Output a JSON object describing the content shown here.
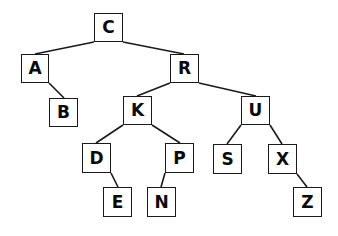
{
  "diagram": {
    "type": "binary-search-tree",
    "colors": {
      "background": "#ffffff",
      "stroke": "#1a1a1a",
      "text": "#0a0a0a"
    },
    "nodes": [
      {
        "id": "C",
        "label": "C",
        "x": 94,
        "y": 13,
        "w": 29,
        "h": 29
      },
      {
        "id": "A",
        "label": "A",
        "x": 21,
        "y": 54,
        "w": 28,
        "h": 29
      },
      {
        "id": "R",
        "label": "R",
        "x": 170,
        "y": 54,
        "w": 29,
        "h": 29
      },
      {
        "id": "B",
        "label": "B",
        "x": 49,
        "y": 98,
        "w": 29,
        "h": 29
      },
      {
        "id": "K",
        "label": "K",
        "x": 123,
        "y": 96,
        "w": 29,
        "h": 29
      },
      {
        "id": "U",
        "label": "U",
        "x": 241,
        "y": 96,
        "w": 29,
        "h": 29
      },
      {
        "id": "D",
        "label": "D",
        "x": 82,
        "y": 143,
        "w": 29,
        "h": 30
      },
      {
        "id": "P",
        "label": "P",
        "x": 165,
        "y": 143,
        "w": 29,
        "h": 30
      },
      {
        "id": "S",
        "label": "S",
        "x": 213,
        "y": 144,
        "w": 29,
        "h": 30
      },
      {
        "id": "X",
        "label": "X",
        "x": 268,
        "y": 144,
        "w": 29,
        "h": 30
      },
      {
        "id": "E",
        "label": "E",
        "x": 103,
        "y": 187,
        "w": 29,
        "h": 30
      },
      {
        "id": "N",
        "label": "N",
        "x": 147,
        "y": 187,
        "w": 29,
        "h": 30
      },
      {
        "id": "Z",
        "label": "Z",
        "x": 293,
        "y": 187,
        "w": 29,
        "h": 30
      }
    ],
    "edges": [
      {
        "from": "C",
        "to": "A",
        "x1": 94,
        "y1": 42,
        "x2": 35,
        "y2": 54
      },
      {
        "from": "C",
        "to": "R",
        "x1": 123,
        "y1": 42,
        "x2": 184,
        "y2": 54
      },
      {
        "from": "A",
        "to": "B",
        "x1": 49,
        "y1": 83,
        "x2": 64,
        "y2": 98
      },
      {
        "from": "R",
        "to": "K",
        "x1": 170,
        "y1": 83,
        "x2": 137,
        "y2": 96
      },
      {
        "from": "R",
        "to": "U",
        "x1": 199,
        "y1": 83,
        "x2": 256,
        "y2": 96
      },
      {
        "from": "K",
        "to": "D",
        "x1": 123,
        "y1": 125,
        "x2": 96,
        "y2": 143
      },
      {
        "from": "K",
        "to": "P",
        "x1": 152,
        "y1": 125,
        "x2": 180,
        "y2": 143
      },
      {
        "from": "U",
        "to": "S",
        "x1": 241,
        "y1": 125,
        "x2": 227,
        "y2": 144
      },
      {
        "from": "U",
        "to": "X",
        "x1": 270,
        "y1": 125,
        "x2": 282,
        "y2": 144
      },
      {
        "from": "D",
        "to": "E",
        "x1": 111,
        "y1": 173,
        "x2": 118,
        "y2": 187
      },
      {
        "from": "P",
        "to": "N",
        "x1": 165,
        "y1": 173,
        "x2": 161,
        "y2": 187
      },
      {
        "from": "X",
        "to": "Z",
        "x1": 297,
        "y1": 174,
        "x2": 307,
        "y2": 187
      }
    ]
  }
}
